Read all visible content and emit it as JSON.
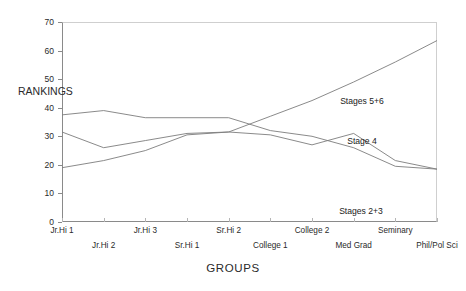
{
  "chart_data": {
    "type": "line",
    "title": "",
    "xlabel": "GROUPS",
    "ylabel": "RANKINGS",
    "ylim": [
      0,
      70
    ],
    "yticks": [
      0,
      10,
      20,
      30,
      40,
      50,
      60,
      70
    ],
    "grid": false,
    "legend_position": "inline-annotations",
    "categories": [
      "Jr.Hi 1",
      "Jr.Hi 2",
      "Jr.Hi 3",
      "Sr.Hi 1",
      "Sr.Hi 2",
      "College 1",
      "College 2",
      "Med Grad",
      "Seminary",
      "Phil/Pol Sci"
    ],
    "series": [
      {
        "name": "Stages 2+3",
        "values": [
          37.5,
          39,
          36.5,
          36.5,
          36.5,
          32,
          30,
          26,
          19.5,
          18.5
        ]
      },
      {
        "name": "Stage 4",
        "values": [
          31.5,
          26,
          28.5,
          31,
          31.5,
          30.5,
          27,
          31,
          21.5,
          18.5
        ]
      },
      {
        "name": "Stages 5+6",
        "values": [
          19,
          21.5,
          25,
          30.5,
          31.5,
          37,
          42.5,
          49,
          56,
          63.5
        ]
      }
    ],
    "annotations": [
      {
        "text": "Stages 5+6",
        "x_px": 362,
        "y_px": 96
      },
      {
        "text": "Stage 4",
        "x_px": 362,
        "y_px": 136
      },
      {
        "text": "Stages 2+3",
        "x_px": 361,
        "y_px": 206
      }
    ]
  },
  "axis": {
    "y_tick_labels": [
      "70",
      "60",
      "50",
      "40",
      "30",
      "20",
      "10",
      "0"
    ],
    "x_tick_labels": [
      "Jr.Hi 1",
      "Jr.Hi 2",
      "Jr.Hi 3",
      "Sr.Hi 1",
      "Sr.Hi 2",
      "College 1",
      "College 2",
      "Med Grad",
      "Seminary",
      "Phil/Pol Sci"
    ],
    "y_title": "RANKINGS",
    "x_title": "GROUPS"
  },
  "colors": {
    "line": "#7d7d7d",
    "axis": "#8a8a8a",
    "text": "#2a2a2a",
    "background": "#ffffff"
  }
}
